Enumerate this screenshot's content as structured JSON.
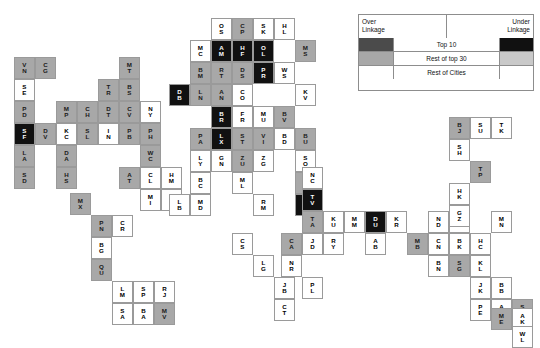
{
  "figure": {
    "type": "city-linkage-grid",
    "background": "#ffffff"
  },
  "legend": {
    "x": 358,
    "y": 14,
    "width": 176,
    "height": 77,
    "header_left": "Over\nLinkage",
    "header_left_line1": "Over",
    "header_left_line2": "Linkage",
    "header_right_line1": "Under",
    "header_right_line2": "Linkage",
    "rows": [
      {
        "label": "Top 10",
        "over_color": "#4b4b4b",
        "under_color": "#111111"
      },
      {
        "label": "Rest of top 30",
        "over_color": "#a8a8a8",
        "under_color": "#c9c9c9"
      },
      {
        "label": "Rest of Cities",
        "over_color": "#ffffff",
        "under_color": "#ffffff"
      }
    ]
  },
  "colors": {
    "over_top10": "#4b4b4b",
    "over_top30": "#a8a8a8",
    "over_rest": "#ffffff",
    "under_top10": "#111111",
    "under_top30": "#c9c9c9",
    "under_rest": "#ffffff",
    "cell_border": "#9a9a9a",
    "text_light": "#ffffff",
    "text_dark": "#000000"
  },
  "grid": {
    "cell_width": 21,
    "cell_height": 22,
    "note": "Each cell is a city code rendered as two stacked letters"
  },
  "cells": [
    {
      "code": "VN",
      "l1": "V",
      "l2": "N",
      "x": 14,
      "y": 57,
      "cls": "c-over-top30"
    },
    {
      "code": "CG",
      "l1": "C",
      "l2": "G",
      "x": 35,
      "y": 57,
      "cls": "c-over-top30"
    },
    {
      "code": "SE",
      "l1": "S",
      "l2": "E",
      "x": 14,
      "y": 79,
      "cls": "c-over-rest"
    },
    {
      "code": "PD",
      "l1": "P",
      "l2": "D",
      "x": 14,
      "y": 101,
      "cls": "c-over-top30"
    },
    {
      "code": "MP",
      "l1": "M",
      "l2": "P",
      "x": 56,
      "y": 101,
      "cls": "c-over-top30"
    },
    {
      "code": "CH",
      "l1": "C",
      "l2": "H",
      "x": 77,
      "y": 101,
      "cls": "c-over-top30"
    },
    {
      "code": "DT",
      "l1": "D",
      "l2": "T",
      "x": 98,
      "y": 101,
      "cls": "c-over-top30"
    },
    {
      "code": "CV",
      "l1": "C",
      "l2": "V",
      "x": 119,
      "y": 101,
      "cls": "c-over-top30"
    },
    {
      "code": "SF",
      "l1": "S",
      "l2": "F",
      "x": 14,
      "y": 123,
      "cls": "c-under-top10"
    },
    {
      "code": "DV",
      "l1": "D",
      "l2": "V",
      "x": 35,
      "y": 123,
      "cls": "c-over-top30"
    },
    {
      "code": "KC",
      "l1": "K",
      "l2": "C",
      "x": 56,
      "y": 123,
      "cls": "c-over-rest"
    },
    {
      "code": "SL",
      "l1": "S",
      "l2": "L",
      "x": 77,
      "y": 123,
      "cls": "c-over-top30"
    },
    {
      "code": "IN",
      "l1": "I",
      "l2": "N",
      "x": 98,
      "y": 123,
      "cls": "c-over-rest"
    },
    {
      "code": "PB",
      "l1": "P",
      "l2": "B",
      "x": 119,
      "y": 123,
      "cls": "c-over-top30"
    },
    {
      "code": "LA",
      "l1": "L",
      "l2": "A",
      "x": 14,
      "y": 145,
      "cls": "c-over-top30"
    },
    {
      "code": "DA",
      "l1": "D",
      "l2": "A",
      "x": 56,
      "y": 145,
      "cls": "c-over-top30"
    },
    {
      "code": "SD",
      "l1": "S",
      "l2": "D",
      "x": 14,
      "y": 167,
      "cls": "c-over-top30"
    },
    {
      "code": "HS",
      "l1": "H",
      "l2": "S",
      "x": 56,
      "y": 167,
      "cls": "c-over-top30"
    },
    {
      "code": "MT",
      "l1": "M",
      "l2": "T",
      "x": 119,
      "y": 57,
      "cls": "c-over-top30"
    },
    {
      "code": "TR",
      "l1": "T",
      "l2": "R",
      "x": 98,
      "y": 79,
      "cls": "c-over-top30"
    },
    {
      "code": "BS",
      "l1": "B",
      "l2": "S",
      "x": 119,
      "y": 79,
      "cls": "c-over-top30"
    },
    {
      "code": "NY",
      "l1": "N",
      "l2": "Y",
      "x": 140,
      "y": 101,
      "cls": "c-over-rest"
    },
    {
      "code": "PH",
      "l1": "P",
      "l2": "H",
      "x": 140,
      "y": 123,
      "cls": "c-over-top30"
    },
    {
      "code": "WC",
      "l1": "W",
      "l2": "C",
      "x": 140,
      "y": 145,
      "cls": "c-over-top30"
    },
    {
      "code": "AT",
      "l1": "A",
      "l2": "T",
      "x": 119,
      "y": 167,
      "cls": "c-over-top30"
    },
    {
      "code": "CL",
      "l1": "C",
      "l2": "L",
      "x": 140,
      "y": 167,
      "cls": "c-over-rest"
    },
    {
      "code": "HM",
      "l1": "H",
      "l2": "M",
      "x": 161,
      "y": 167,
      "cls": "c-over-rest"
    },
    {
      "code": "MI",
      "l1": "M",
      "l2": "I",
      "x": 140,
      "y": 189,
      "cls": "c-over-rest"
    },
    {
      "code": "NS",
      "l1": "N",
      "l2": "S",
      "x": 161,
      "y": 189,
      "cls": "c-over-rest"
    },
    {
      "code": "MX",
      "l1": "M",
      "l2": "X",
      "x": 70,
      "y": 193,
      "cls": "c-over-top30"
    },
    {
      "code": "PN",
      "l1": "P",
      "l2": "N",
      "x": 91,
      "y": 215,
      "cls": "c-over-top30"
    },
    {
      "code": "CR",
      "l1": "C",
      "l2": "R",
      "x": 112,
      "y": 215,
      "cls": "c-over-rest"
    },
    {
      "code": "BG",
      "l1": "B",
      "l2": "G",
      "x": 91,
      "y": 237,
      "cls": "c-over-rest"
    },
    {
      "code": "QU",
      "l1": "Q",
      "l2": "U",
      "x": 91,
      "y": 259,
      "cls": "c-over-top30"
    },
    {
      "code": "LM",
      "l1": "L",
      "l2": "M",
      "x": 112,
      "y": 281,
      "cls": "c-over-rest"
    },
    {
      "code": "SP",
      "l1": "S",
      "l2": "P",
      "x": 133,
      "y": 281,
      "cls": "c-over-rest"
    },
    {
      "code": "RJ",
      "l1": "R",
      "l2": "J",
      "x": 154,
      "y": 281,
      "cls": "c-over-rest"
    },
    {
      "code": "SA",
      "l1": "S",
      "l2": "A",
      "x": 112,
      "y": 303,
      "cls": "c-over-rest"
    },
    {
      "code": "BA",
      "l1": "B",
      "l2": "A",
      "x": 133,
      "y": 303,
      "cls": "c-over-rest"
    },
    {
      "code": "MV",
      "l1": "M",
      "l2": "V",
      "x": 154,
      "y": 303,
      "cls": "c-over-top30"
    },
    {
      "code": "OS",
      "l1": "O",
      "l2": "S",
      "x": 211,
      "y": 18,
      "cls": "c-over-rest"
    },
    {
      "code": "CP",
      "l1": "C",
      "l2": "P",
      "x": 232,
      "y": 18,
      "cls": "c-over-top30"
    },
    {
      "code": "SK",
      "l1": "S",
      "l2": "K",
      "x": 253,
      "y": 18,
      "cls": "c-over-rest"
    },
    {
      "code": "HL",
      "l1": "H",
      "l2": "L",
      "x": 274,
      "y": 18,
      "cls": "c-over-rest"
    },
    {
      "code": "MC",
      "l1": "M",
      "l2": "C",
      "x": 190,
      "y": 40,
      "cls": "c-over-rest"
    },
    {
      "code": "AM",
      "l1": "A",
      "l2": "M",
      "x": 211,
      "y": 40,
      "cls": "c-under-top10"
    },
    {
      "code": "HF",
      "l1": "H",
      "l2": "F",
      "x": 232,
      "y": 40,
      "cls": "c-under-top10"
    },
    {
      "code": "OL",
      "l1": "O",
      "l2": "L",
      "x": 253,
      "y": 40,
      "cls": "c-under-top10"
    },
    {
      "code": "MS",
      "l1": "M",
      "l2": "S",
      "x": 295,
      "y": 40,
      "cls": "c-over-top30"
    },
    {
      "code": "BM",
      "l1": "B",
      "l2": "M",
      "x": 190,
      "y": 62,
      "cls": "c-over-top30"
    },
    {
      "code": "RT",
      "l1": "R",
      "l2": "T",
      "x": 211,
      "y": 62,
      "cls": "c-over-top30"
    },
    {
      "code": "DS",
      "l1": "D",
      "l2": "S",
      "x": 232,
      "y": 62,
      "cls": "c-over-top30"
    },
    {
      "code": "PR",
      "l1": "P",
      "l2": "R",
      "x": 253,
      "y": 62,
      "cls": "c-under-top10"
    },
    {
      "code": "WS",
      "l1": "W",
      "l2": "S",
      "x": 274,
      "y": 62,
      "cls": "c-over-rest"
    },
    {
      "code": "DB",
      "l1": "D",
      "l2": "B",
      "x": 169,
      "y": 84,
      "cls": "c-under-top10"
    },
    {
      "code": "LN",
      "l1": "L",
      "l2": "N",
      "x": 190,
      "y": 84,
      "cls": "c-over-top30"
    },
    {
      "code": "AN",
      "l1": "A",
      "l2": "N",
      "x": 211,
      "y": 84,
      "cls": "c-over-top30"
    },
    {
      "code": "CO",
      "l1": "C",
      "l2": "O",
      "x": 232,
      "y": 84,
      "cls": "c-over-rest"
    },
    {
      "code": "KV",
      "l1": "K",
      "l2": "V",
      "x": 295,
      "y": 84,
      "cls": "c-over-rest"
    },
    {
      "code": "BR",
      "l1": "B",
      "l2": "R",
      "x": 211,
      "y": 106,
      "cls": "c-under-top10"
    },
    {
      "code": "FR",
      "l1": "F",
      "l2": "R",
      "x": 232,
      "y": 106,
      "cls": "c-over-rest"
    },
    {
      "code": "MU",
      "l1": "M",
      "l2": "U",
      "x": 253,
      "y": 106,
      "cls": "c-over-rest"
    },
    {
      "code": "BV",
      "l1": "B",
      "l2": "V",
      "x": 274,
      "y": 106,
      "cls": "c-over-top30"
    },
    {
      "code": "PA",
      "l1": "P",
      "l2": "A",
      "x": 190,
      "y": 128,
      "cls": "c-over-top30"
    },
    {
      "code": "LX",
      "l1": "L",
      "l2": "X",
      "x": 211,
      "y": 128,
      "cls": "c-under-top10"
    },
    {
      "code": "ST",
      "l1": "S",
      "l2": "T",
      "x": 232,
      "y": 128,
      "cls": "c-over-top30"
    },
    {
      "code": "VI",
      "l1": "V",
      "l2": "I",
      "x": 253,
      "y": 128,
      "cls": "c-over-top30"
    },
    {
      "code": "BD",
      "l1": "B",
      "l2": "D",
      "x": 274,
      "y": 128,
      "cls": "c-over-rest"
    },
    {
      "code": "BU",
      "l1": "B",
      "l2": "U",
      "x": 295,
      "y": 128,
      "cls": "c-over-top30"
    },
    {
      "code": "LY",
      "l1": "L",
      "l2": "Y",
      "x": 190,
      "y": 150,
      "cls": "c-over-rest"
    },
    {
      "code": "GN",
      "l1": "G",
      "l2": "N",
      "x": 211,
      "y": 150,
      "cls": "c-over-rest"
    },
    {
      "code": "ZU",
      "l1": "Z",
      "l2": "U",
      "x": 232,
      "y": 150,
      "cls": "c-over-top30"
    },
    {
      "code": "ZG",
      "l1": "Z",
      "l2": "G",
      "x": 253,
      "y": 150,
      "cls": "c-over-rest"
    },
    {
      "code": "SO",
      "l1": "S",
      "l2": "O",
      "x": 295,
      "y": 150,
      "cls": "c-over-rest"
    },
    {
      "code": "BC",
      "l1": "B",
      "l2": "C",
      "x": 190,
      "y": 172,
      "cls": "c-over-rest"
    },
    {
      "code": "ML",
      "l1": "M",
      "l2": "L",
      "x": 232,
      "y": 172,
      "cls": "c-over-rest"
    },
    {
      "code": "IS",
      "l1": "I",
      "l2": "S",
      "x": 295,
      "y": 172,
      "cls": "c-over-top30"
    },
    {
      "code": "LB",
      "l1": "L",
      "l2": "B",
      "x": 169,
      "y": 194,
      "cls": "c-over-rest"
    },
    {
      "code": "MD",
      "l1": "M",
      "l2": "D",
      "x": 190,
      "y": 194,
      "cls": "c-over-rest"
    },
    {
      "code": "RM",
      "l1": "R",
      "l2": "M",
      "x": 253,
      "y": 194,
      "cls": "c-over-rest"
    },
    {
      "code": "AT2",
      "l1": "A",
      "l2": "T",
      "x": 295,
      "y": 194,
      "cls": "c-under-top10"
    },
    {
      "code": "NC",
      "l1": "N",
      "l2": "C",
      "x": 302,
      "y": 167,
      "cls": "c-over-rest"
    },
    {
      "code": "TV",
      "l1": "T",
      "l2": "V",
      "x": 302,
      "y": 189,
      "cls": "c-under-top10"
    },
    {
      "code": "TA",
      "l1": "T",
      "l2": "A",
      "x": 302,
      "y": 211,
      "cls": "c-over-top30"
    },
    {
      "code": "KU",
      "l1": "K",
      "l2": "U",
      "x": 323,
      "y": 211,
      "cls": "c-over-rest"
    },
    {
      "code": "MM",
      "l1": "M",
      "l2": "M",
      "x": 344,
      "y": 211,
      "cls": "c-over-rest"
    },
    {
      "code": "DU",
      "l1": "D",
      "l2": "U",
      "x": 365,
      "y": 211,
      "cls": "c-under-top10"
    },
    {
      "code": "KR",
      "l1": "K",
      "l2": "R",
      "x": 386,
      "y": 211,
      "cls": "c-over-rest"
    },
    {
      "code": "ND",
      "l1": "N",
      "l2": "D",
      "x": 428,
      "y": 211,
      "cls": "c-over-rest"
    },
    {
      "code": "CC",
      "l1": "C",
      "l2": "C",
      "x": 449,
      "y": 211,
      "cls": "c-over-rest"
    },
    {
      "code": "CA",
      "l1": "C",
      "l2": "A",
      "x": 281,
      "y": 233,
      "cls": "c-over-top30"
    },
    {
      "code": "JO",
      "l1": "J",
      "l2": "D",
      "x": 302,
      "y": 233,
      "cls": "c-over-rest"
    },
    {
      "code": "RY",
      "l1": "R",
      "l2": "Y",
      "x": 323,
      "y": 233,
      "cls": "c-over-rest"
    },
    {
      "code": "AB",
      "l1": "A",
      "l2": "B",
      "x": 365,
      "y": 233,
      "cls": "c-over-rest"
    },
    {
      "code": "MB",
      "l1": "M",
      "l2": "B",
      "x": 407,
      "y": 233,
      "cls": "c-over-top30"
    },
    {
      "code": "CN",
      "l1": "C",
      "l2": "N",
      "x": 428,
      "y": 233,
      "cls": "c-over-rest"
    },
    {
      "code": "NR",
      "l1": "N",
      "l2": "R",
      "x": 281,
      "y": 255,
      "cls": "c-over-rest"
    },
    {
      "code": "BN",
      "l1": "B",
      "l2": "N",
      "x": 428,
      "y": 255,
      "cls": "c-over-rest"
    },
    {
      "code": "PL",
      "l1": "P",
      "l2": "L",
      "x": 302,
      "y": 277,
      "cls": "c-over-rest"
    },
    {
      "code": "CS",
      "l1": "C",
      "l2": "S",
      "x": 232,
      "y": 233,
      "cls": "c-over-rest"
    },
    {
      "code": "LG",
      "l1": "L",
      "l2": "G",
      "x": 253,
      "y": 255,
      "cls": "c-over-rest"
    },
    {
      "code": "JB",
      "l1": "J",
      "l2": "B",
      "x": 274,
      "y": 277,
      "cls": "c-over-rest"
    },
    {
      "code": "CT",
      "l1": "C",
      "l2": "T",
      "x": 274,
      "y": 299,
      "cls": "c-over-rest"
    },
    {
      "code": "BJ",
      "l1": "B",
      "l2": "J",
      "x": 449,
      "y": 117,
      "cls": "c-over-top30"
    },
    {
      "code": "SU",
      "l1": "S",
      "l2": "U",
      "x": 470,
      "y": 117,
      "cls": "c-over-rest"
    },
    {
      "code": "TK",
      "l1": "T",
      "l2": "K",
      "x": 491,
      "y": 117,
      "cls": "c-over-rest"
    },
    {
      "code": "SH",
      "l1": "S",
      "l2": "H",
      "x": 449,
      "y": 139,
      "cls": "c-over-rest"
    },
    {
      "code": "TP",
      "l1": "T",
      "l2": "P",
      "x": 470,
      "y": 161,
      "cls": "c-over-top30"
    },
    {
      "code": "HK",
      "l1": "H",
      "l2": "K",
      "x": 449,
      "y": 183,
      "cls": "c-over-rest"
    },
    {
      "code": "GZ",
      "l1": "G",
      "l2": "Z",
      "x": 449,
      "y": 205,
      "cls": "c-over-rest"
    },
    {
      "code": "MN",
      "l1": "M",
      "l2": "N",
      "x": 491,
      "y": 211,
      "cls": "c-over-rest"
    },
    {
      "code": "BK",
      "l1": "B",
      "l2": "K",
      "x": 449,
      "y": 233,
      "cls": "c-over-rest"
    },
    {
      "code": "HC",
      "l1": "H",
      "l2": "C",
      "x": 470,
      "y": 233,
      "cls": "c-over-rest"
    },
    {
      "code": "SG",
      "l1": "S",
      "l2": "G",
      "x": 449,
      "y": 255,
      "cls": "c-over-top30"
    },
    {
      "code": "KL",
      "l1": "K",
      "l2": "L",
      "x": 470,
      "y": 255,
      "cls": "c-over-rest"
    },
    {
      "code": "JK",
      "l1": "J",
      "l2": "K",
      "x": 470,
      "y": 277,
      "cls": "c-over-rest"
    },
    {
      "code": "BB",
      "l1": "B",
      "l2": "B",
      "x": 491,
      "y": 277,
      "cls": "c-over-rest"
    },
    {
      "code": "PE",
      "l1": "P",
      "l2": "E",
      "x": 470,
      "y": 299,
      "cls": "c-over-rest"
    },
    {
      "code": "AD",
      "l1": "A",
      "l2": "D",
      "x": 491,
      "y": 299,
      "cls": "c-over-rest"
    },
    {
      "code": "SY",
      "l1": "S",
      "l2": "Y",
      "x": 512,
      "y": 299,
      "cls": "c-over-top30"
    },
    {
      "code": "ME",
      "l1": "M",
      "l2": "E",
      "x": 491,
      "y": 308,
      "cls": "c-over-top30"
    },
    {
      "code": "AK",
      "l1": "A",
      "l2": "K",
      "x": 512,
      "y": 308,
      "cls": "c-over-rest"
    },
    {
      "code": "WL",
      "l1": "W",
      "l2": "L",
      "x": 512,
      "y": 326,
      "cls": "c-over-rest"
    }
  ]
}
